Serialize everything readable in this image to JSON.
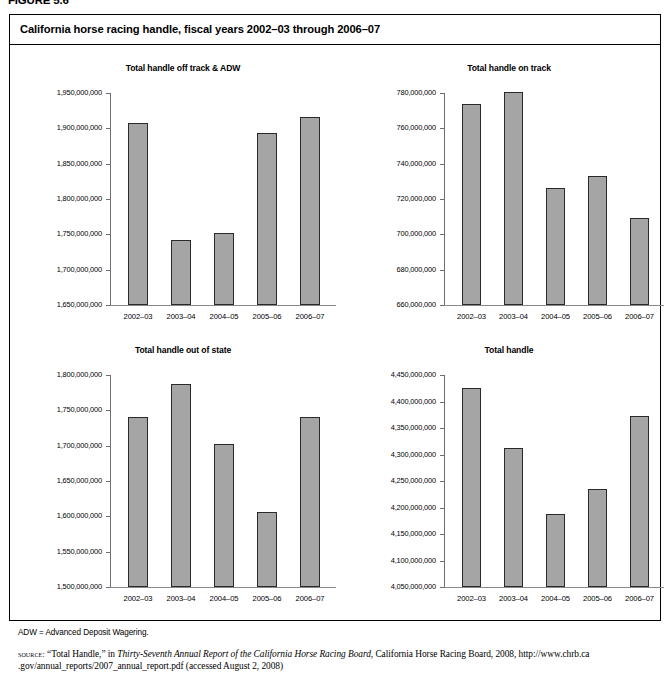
{
  "figure": {
    "number": "FIGURE 5.6",
    "title": "California horse racing handle, fiscal years 2002–03 through 2006–07",
    "footnote": "ADW = Advanced Deposit Wagering.",
    "source_kicker": "source:",
    "source_line1_a": " “Total Handle,” in ",
    "source_line1_italic": "Thirty-Seventh Annual Report of the California Horse Racing Board",
    "source_line1_b": ", California Horse Racing Board, 2008, http://www.chrb.ca",
    "source_line2": ".gov/annual_reports/2007_annual_report.pdf (accessed August 2, 2008)"
  },
  "chart_data": [
    {
      "type": "bar",
      "id": "off-track-adw",
      "title": "Total handle off track & ADW",
      "categories": [
        "2002–03",
        "2003–04",
        "2004–05",
        "2005–06",
        "2006–07"
      ],
      "values": [
        1908000000,
        1742000000,
        1752000000,
        1893000000,
        1916000000
      ],
      "ylim": [
        1650000000,
        1950000000
      ],
      "ytick_step": 50000000,
      "ytick_labels": [
        "1,950,000,000",
        "1,900,000,000",
        "1,850,000,000",
        "1,800,000,000",
        "1,750,000,000",
        "1,700,000,000",
        "1,650,000,000"
      ],
      "xlabel": "",
      "ylabel": "",
      "grid": false,
      "legend": "none"
    },
    {
      "type": "bar",
      "id": "on-track",
      "title": "Total handle on track",
      "categories": [
        "2002–03",
        "2003–04",
        "2004–05",
        "2005–06",
        "2006–07"
      ],
      "values": [
        774000000,
        780500000,
        726000000,
        733000000,
        709000000
      ],
      "ylim": [
        660000000,
        780000000
      ],
      "ytick_step": 20000000,
      "ytick_labels": [
        "780,000,000",
        "760,000,000",
        "740,000,000",
        "720,000,000",
        "700,000,000",
        "680,000,000",
        "660,000,000"
      ],
      "xlabel": "",
      "ylabel": "",
      "grid": false,
      "legend": "none"
    },
    {
      "type": "bar",
      "id": "out-of-state",
      "title": "Total handle out of state",
      "categories": [
        "2002–03",
        "2003–04",
        "2004–05",
        "2005–06",
        "2006–07"
      ],
      "values": [
        1741000000,
        1787000000,
        1702000000,
        1606000000,
        1741000000
      ],
      "ylim": [
        1500000000,
        1800000000
      ],
      "ytick_step": 50000000,
      "ytick_labels": [
        "1,800,000,000",
        "1,750,000,000",
        "1,700,000,000",
        "1,650,000,000",
        "1,600,000,000",
        "1,550,000,000",
        "1,500,000,000"
      ],
      "xlabel": "",
      "ylabel": "",
      "grid": false,
      "legend": "none"
    },
    {
      "type": "bar",
      "id": "total-handle",
      "title": "Total handle",
      "categories": [
        "2002–03",
        "2003–04",
        "2004–05",
        "2005–06",
        "2006–07"
      ],
      "values": [
        4426000000,
        4312000000,
        4187000000,
        4234000000,
        4372000000
      ],
      "ylim": [
        4050000000,
        4450000000
      ],
      "ytick_step": 50000000,
      "ytick_labels": [
        "4,450,000,000",
        "4,400,000,000",
        "4,350,000,000",
        "4,300,000,000",
        "4,250,000,000",
        "4,200,000,000",
        "4,150,000,000",
        "4,100,000,000",
        "4,050,000,000"
      ],
      "xlabel": "",
      "ylabel": "",
      "grid": false,
      "legend": "none"
    }
  ],
  "style": {
    "bar_fill": "#a5a5a5",
    "bar_stroke": "#2a2a2a",
    "axis_color": "#6f6f6f",
    "text_color": "#000000",
    "background": "#ffffff"
  },
  "layout": {
    "panels": [
      {
        "left": 14,
        "top": 48,
        "width": 318,
        "height": 262,
        "plot_left": 86,
        "plot_top": 30,
        "plot_width": 216,
        "plot_height": 212
      },
      {
        "left": 340,
        "top": 48,
        "width": 318,
        "height": 262,
        "plot_left": 94,
        "plot_top": 30,
        "plot_width": 210,
        "plot_height": 212
      },
      {
        "left": 14,
        "top": 330,
        "width": 318,
        "height": 262,
        "plot_left": 86,
        "plot_top": 30,
        "plot_width": 216,
        "plot_height": 212
      },
      {
        "left": 340,
        "top": 330,
        "width": 318,
        "height": 262,
        "plot_left": 94,
        "plot_top": 30,
        "plot_width": 210,
        "plot_height": 212
      }
    ]
  }
}
